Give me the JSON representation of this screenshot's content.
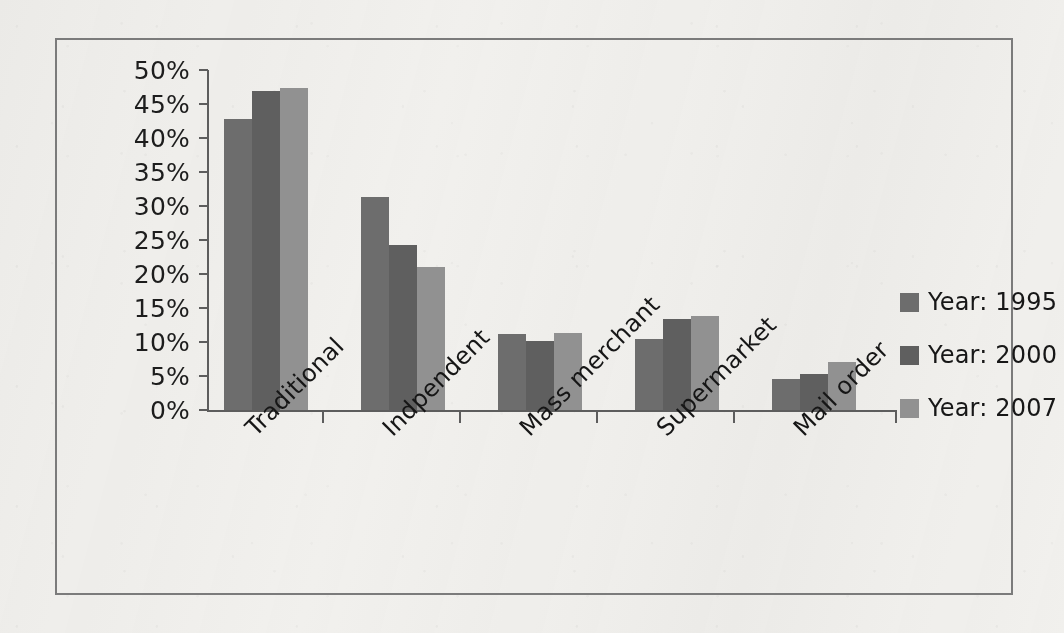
{
  "chart_data": {
    "type": "bar",
    "title": "",
    "xlabel": "",
    "ylabel": "",
    "categories": [
      "Traditional",
      "Indpendent",
      "Mass merchant",
      "Supermarket",
      "Mail order"
    ],
    "series": [
      {
        "name": "Year: 1995",
        "color": "#6d6d6d",
        "values": [
          42.8,
          31.3,
          11.2,
          10.4,
          4.5
        ]
      },
      {
        "name": "Year: 2000",
        "color": "#5f5f5f",
        "values": [
          46.9,
          24.3,
          10.2,
          13.4,
          5.3
        ]
      },
      {
        "name": "Year: 2007",
        "color": "#919191",
        "values": [
          47.3,
          21.0,
          11.3,
          13.8,
          7.0
        ]
      }
    ],
    "ylim": [
      0,
      50
    ],
    "ytick_values": [
      0,
      5,
      10,
      15,
      20,
      25,
      30,
      35,
      40,
      45,
      50
    ],
    "ytick_labels": [
      "0%",
      "5%",
      "10%",
      "15%",
      "20%",
      "25%",
      "30%",
      "35%",
      "40%",
      "45%",
      "50%"
    ],
    "grid": false,
    "legend_position": "right",
    "value_suffix": "%"
  }
}
